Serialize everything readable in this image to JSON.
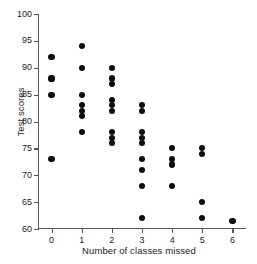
{
  "chart_data": {
    "type": "scatter",
    "title": "",
    "xlabel": "Number of classes missed",
    "ylabel": "Test scores",
    "xlim": [
      -0.45,
      6.45
    ],
    "ylim": [
      60,
      100
    ],
    "xticks": [
      0,
      1,
      2,
      3,
      4,
      5,
      6
    ],
    "yticks": [
      60,
      65,
      70,
      75,
      80,
      85,
      90,
      95,
      100
    ],
    "xtick_labels": [
      "0",
      "1",
      "2",
      "3",
      "4",
      "5",
      "6"
    ],
    "ytick_labels": [
      "60",
      "65",
      "70",
      "75",
      "80",
      "85",
      "90",
      "95",
      "100"
    ],
    "grid": false,
    "legend": null,
    "marker": "filled-circle",
    "marker_color": "#0d0d0d",
    "axis_color": "#555555",
    "points": [
      {
        "x": 0,
        "y": 92
      },
      {
        "x": 0,
        "y": 88
      },
      {
        "x": 0,
        "y": 85
      },
      {
        "x": 0,
        "y": 73
      },
      {
        "x": 1,
        "y": 94
      },
      {
        "x": 1,
        "y": 90
      },
      {
        "x": 1,
        "y": 85
      },
      {
        "x": 1,
        "y": 83
      },
      {
        "x": 1,
        "y": 82
      },
      {
        "x": 1,
        "y": 81
      },
      {
        "x": 1,
        "y": 78
      },
      {
        "x": 2,
        "y": 90
      },
      {
        "x": 2,
        "y": 88
      },
      {
        "x": 2,
        "y": 87
      },
      {
        "x": 2,
        "y": 84
      },
      {
        "x": 2,
        "y": 83
      },
      {
        "x": 2,
        "y": 82
      },
      {
        "x": 2,
        "y": 78
      },
      {
        "x": 2,
        "y": 77
      },
      {
        "x": 2,
        "y": 76
      },
      {
        "x": 3,
        "y": 83
      },
      {
        "x": 3,
        "y": 82
      },
      {
        "x": 3,
        "y": 78
      },
      {
        "x": 3,
        "y": 77
      },
      {
        "x": 3,
        "y": 76
      },
      {
        "x": 3,
        "y": 73
      },
      {
        "x": 3,
        "y": 71
      },
      {
        "x": 3,
        "y": 68
      },
      {
        "x": 3,
        "y": 62
      },
      {
        "x": 4,
        "y": 75
      },
      {
        "x": 4,
        "y": 73
      },
      {
        "x": 4,
        "y": 72
      },
      {
        "x": 4,
        "y": 68
      },
      {
        "x": 5,
        "y": 75
      },
      {
        "x": 5,
        "y": 74
      },
      {
        "x": 5,
        "y": 65
      },
      {
        "x": 5,
        "y": 62
      },
      {
        "x": 6,
        "y": 61.5
      }
    ]
  }
}
